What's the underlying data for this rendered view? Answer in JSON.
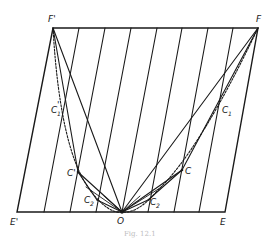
{
  "diagram": {
    "caption": "Fig. 12.1",
    "colors": {
      "ink": "#1a1a1a",
      "caption": "#bdbdbd",
      "background": "#ffffff"
    },
    "points": {
      "F_prime": {
        "label": "F'",
        "x": 53,
        "y": 28
      },
      "F": {
        "label": "F",
        "x": 258,
        "y": 28
      },
      "E_prime": {
        "label": "E'",
        "x": 17,
        "y": 212
      },
      "E": {
        "label": "E",
        "x": 225,
        "y": 212
      },
      "O": {
        "label": "O",
        "x": 122,
        "y": 212
      },
      "C_prime": {
        "label": "C'",
        "x": 78,
        "y": 172
      },
      "C": {
        "label": "C",
        "x": 182,
        "y": 170
      },
      "C1_prime": {
        "label": "C'1",
        "x": 62,
        "y": 110
      },
      "C1": {
        "label": "C1",
        "x": 222,
        "y": 110
      },
      "C2_prime": {
        "label": "C'2",
        "x": 97,
        "y": 200
      },
      "C2": {
        "label": "C2",
        "x": 148,
        "y": 200
      }
    },
    "labels": {
      "F_prime": "F'",
      "F": "F",
      "E_prime": "E'",
      "E": "E",
      "O": "O",
      "C_prime": "C'",
      "C": "C",
      "C1_prime_main": "C",
      "C1_prime_sub": "1",
      "C1_prime_mark": "'",
      "C1_main": "C",
      "C1_sub": "1",
      "C2_prime_main": "C",
      "C2_prime_sub": "2",
      "C2_prime_mark": "'",
      "C2_main": "C",
      "C2_sub": "2"
    },
    "parallelogram": {
      "top_y": 28,
      "bottom_y": 212,
      "top_left_x": 53,
      "top_right_x": 258,
      "bottom_left_x": 17,
      "bottom_right_x": 225
    },
    "hatch_lines": {
      "count": 7,
      "top_x": [
        79,
        105,
        131,
        157,
        182,
        208,
        233
      ],
      "bottom_x": [
        44,
        70,
        96,
        122,
        148,
        174,
        199
      ]
    }
  }
}
